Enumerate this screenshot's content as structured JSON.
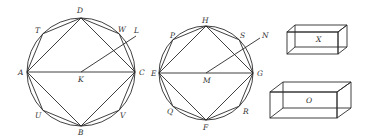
{
  "figures": {
    "circle1": {
      "center": {
        "label": "K",
        "x": 81,
        "y": 72
      },
      "radius": 54,
      "square": [
        "A",
        "D",
        "C",
        "B"
      ],
      "octagon": [
        "A",
        "T",
        "D",
        "W",
        "C",
        "V",
        "B",
        "U"
      ],
      "ray_label": "L",
      "labels": {
        "A": "A",
        "B": "B",
        "C": "C",
        "D": "D",
        "K": "K",
        "L": "L",
        "T": "T",
        "U": "U",
        "V": "V",
        "W": "W"
      }
    },
    "circle2": {
      "center": {
        "label": "M",
        "x": 206,
        "y": 73
      },
      "radius": 47,
      "square": [
        "E",
        "H",
        "G",
        "F"
      ],
      "octagon": [
        "E",
        "P",
        "H",
        "S",
        "G",
        "R",
        "F",
        "Q"
      ],
      "ray_label": "N",
      "labels": {
        "E": "E",
        "F": "F",
        "G": "G",
        "H": "H",
        "M": "M",
        "N": "N",
        "P": "P",
        "Q": "Q",
        "R": "R",
        "S": "S"
      }
    },
    "solids": [
      {
        "label": "X"
      },
      {
        "label": "O"
      }
    ]
  }
}
